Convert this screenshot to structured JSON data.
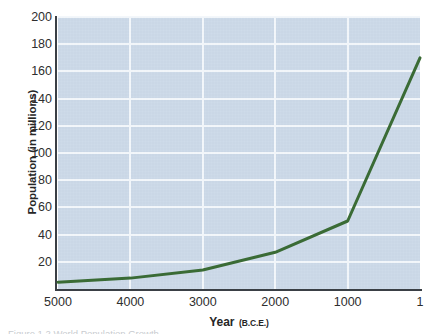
{
  "figure": {
    "caption": "Figure 1.2  World Population Growth",
    "background_color": "#ffffff"
  },
  "chart_data": {
    "type": "line",
    "title": "",
    "xlabel": "Year",
    "xlabel_unit": "(B.C.E.)",
    "ylabel": "Population (in millions)",
    "x": [
      5000,
      4000,
      3000,
      2000,
      1000,
      1
    ],
    "values": [
      5,
      8,
      14,
      27,
      50,
      170
    ],
    "series": [
      {
        "name": "World population",
        "values": [
          5,
          8,
          14,
          27,
          50,
          170
        ],
        "color": "#3a6b35"
      }
    ],
    "xtick_labels": [
      "5000",
      "4000",
      "3000",
      "2000",
      "1000",
      "1"
    ],
    "ytick_labels": [
      "20",
      "40",
      "60",
      "80",
      "100",
      "120",
      "140",
      "160",
      "180",
      "200"
    ],
    "ytick_values": [
      20,
      40,
      60,
      80,
      100,
      120,
      140,
      160,
      180,
      200
    ],
    "xlim": [
      5000,
      1
    ],
    "ylim": [
      0,
      200
    ],
    "x_axis_reversed": true,
    "grid": "horizontal-and-vertical",
    "gridline_color": "#f3f7fb",
    "plot_background_color": "#ccd9e8",
    "axis_color": "#3a3f45",
    "legend": "none"
  }
}
